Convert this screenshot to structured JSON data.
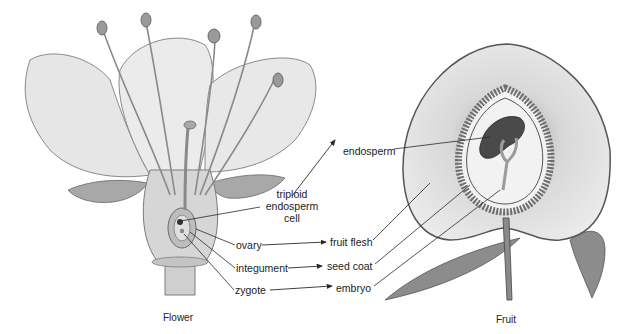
{
  "figure": {
    "flower": {
      "caption": "Flower",
      "labels": {
        "triploid_line1": "triploid",
        "triploid_line2": "endosperm",
        "triploid_line3": "cell",
        "ovary": "ovary",
        "integument": "integument",
        "zygote": "zygote"
      }
    },
    "fruit": {
      "caption": "Fruit",
      "labels": {
        "endosperm": "endosperm",
        "fruit_flesh": "fruit flesh",
        "seed_coat": "seed coat",
        "embryo": "embryo"
      }
    },
    "mappings": [
      {
        "from": "triploid endosperm cell",
        "to": "endosperm"
      },
      {
        "from": "ovary",
        "to": "fruit flesh"
      },
      {
        "from": "integument",
        "to": "seed coat"
      },
      {
        "from": "zygote",
        "to": "embryo"
      }
    ],
    "colors": {
      "background": "#ffffff",
      "line": "#2a2a2a",
      "petal": "#e4e4e4",
      "petal_stroke": "#8a8a8a",
      "flesh": "#e6e6e6",
      "seed_ring": "#7a7a7a",
      "endosperm": "#4a4a4a",
      "leaf": "#8c8c8c"
    }
  }
}
